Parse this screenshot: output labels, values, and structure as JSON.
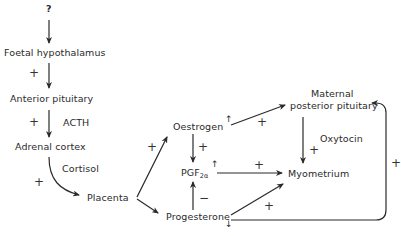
{
  "nodes": {
    "question": "?",
    "foetal_hypothalamus": "Foetal hypothalamus",
    "anterior_pituitary": "Anterior pituitary",
    "adrenal_cortex": "Adrenal cortex",
    "placenta": "Placenta",
    "oestrogen": "Oestrogen",
    "pgf_base": "PGF",
    "pgf_sub": "2α",
    "progesterone": "Progesterone",
    "maternal": "Maternal",
    "posterior_pituitary": "posterior pituitary",
    "myometrium": "Myometrium"
  },
  "edge_labels": {
    "acth": "ACTH",
    "cortisol": "Cortisol",
    "oxytocin": "Oxytocin"
  },
  "signs": {
    "plus": "+",
    "minus": "−"
  },
  "trend_arrows": {
    "up": "↑",
    "down": "↓"
  }
}
